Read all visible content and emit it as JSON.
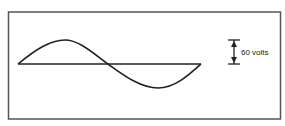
{
  "diagram": {
    "type": "sine-wave-amplitude",
    "amplitude_label": "60 volts",
    "colors": {
      "stroke": "#222222",
      "border": "#555555",
      "background": "#ffffff"
    }
  }
}
